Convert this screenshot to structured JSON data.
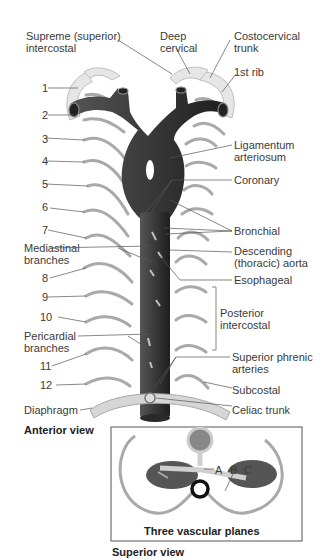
{
  "diagram": {
    "title_anterior": "Anterior view",
    "title_superior": "Superior view",
    "inset_caption": "Three vascular planes",
    "inset_labels": [
      "A",
      "B",
      "C"
    ],
    "left_labels": {
      "supreme": "Supreme (superior)\nintercostal",
      "mediastinal": "Mediastinal\nbranches",
      "pericardial": "Pericardial\nbranches",
      "diaphragm": "Diaphragm"
    },
    "top_labels": {
      "deep_cervical": "Deep\ncervical",
      "costocervical": "Costocervical\ntrunk",
      "first_rib": "1st rib"
    },
    "right_labels": {
      "ligamentum": "Ligamentum\narteriosum",
      "coronary": "Coronary",
      "bronchial": "Bronchial",
      "descending": "Descending\n(thoracic) aorta",
      "esophageal": "Esophageal",
      "posterior_intercostal": "Posterior\nintercostal",
      "superior_phrenic": "Superior phrenic\narteries",
      "subcostal": "Subcostal",
      "celiac": "Celiac trunk"
    },
    "rib_numbers": [
      "1",
      "2",
      "3",
      "4",
      "5",
      "6",
      "7",
      "8",
      "9",
      "10",
      "11",
      "12"
    ],
    "colors": {
      "aorta": "#3a3a3a",
      "branch": "#a9a9a9",
      "rib": "#d8d8d8",
      "lung": "#555555",
      "line": "#555555"
    }
  }
}
